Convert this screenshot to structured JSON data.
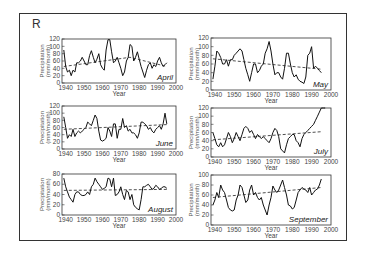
{
  "figure": {
    "panel_letter": "R"
  },
  "chart_data": [
    {
      "type": "line",
      "title": "April",
      "xlabel": "Year",
      "ylabel": "Precipitation (mm/month)",
      "xticks": [
        1940,
        1950,
        1960,
        1970,
        1980,
        1990,
        2000
      ],
      "yticks": [
        0,
        20,
        40,
        60,
        80,
        100,
        120
      ],
      "xlim": [
        1938,
        2000
      ],
      "ylim": [
        0,
        120
      ],
      "x": [
        1939,
        1940,
        1941,
        1942,
        1943,
        1944,
        1945,
        1946,
        1947,
        1948,
        1949,
        1950,
        1951,
        1952,
        1953,
        1954,
        1955,
        1956,
        1957,
        1958,
        1959,
        1960,
        1961,
        1962,
        1963,
        1964,
        1965,
        1966,
        1967,
        1968,
        1969,
        1970,
        1971,
        1972,
        1973,
        1974,
        1975,
        1976,
        1977,
        1978,
        1979,
        1980,
        1981,
        1982,
        1983,
        1984,
        1985,
        1986,
        1987,
        1988,
        1989,
        1990,
        1991,
        1992,
        1993,
        1994,
        1995
      ],
      "series": [
        {
          "name": "Observed",
          "values": [
            90,
            45,
            30,
            35,
            20,
            35,
            30,
            55,
            55,
            60,
            70,
            60,
            50,
            50,
            75,
            88,
            70,
            55,
            65,
            80,
            50,
            40,
            35,
            90,
            118,
            118,
            85,
            55,
            60,
            70,
            55,
            40,
            20,
            30,
            60,
            70,
            105,
            100,
            60,
            70,
            85,
            65,
            45,
            30,
            15,
            35,
            50,
            55,
            40,
            50,
            45,
            60,
            70,
            55,
            45,
            50,
            55
          ]
        },
        {
          "name": "Trend",
          "style": "dashed",
          "values_endpoints": {
            "1939": 45,
            "1975": 70,
            "1995": 45
          }
        }
      ]
    },
    {
      "type": "line",
      "title": "May",
      "xlabel": "Year",
      "ylabel": "Precipitation (mm/month)",
      "xticks": [
        1940,
        1950,
        1960,
        1970,
        1980,
        1990,
        2000
      ],
      "yticks": [
        0,
        20,
        40,
        60,
        80,
        100,
        120
      ],
      "xlim": [
        1938,
        2000
      ],
      "ylim": [
        0,
        120
      ],
      "x": [
        1939,
        1940,
        1941,
        1942,
        1943,
        1944,
        1945,
        1946,
        1947,
        1948,
        1949,
        1950,
        1951,
        1952,
        1953,
        1954,
        1955,
        1956,
        1957,
        1958,
        1959,
        1960,
        1961,
        1962,
        1963,
        1964,
        1965,
        1966,
        1967,
        1968,
        1969,
        1970,
        1971,
        1972,
        1973,
        1974,
        1975,
        1976,
        1977,
        1978,
        1979,
        1980,
        1981,
        1982,
        1983,
        1984,
        1985,
        1986,
        1987,
        1988,
        1989,
        1990,
        1991,
        1992,
        1993,
        1994,
        1995
      ],
      "series": [
        {
          "name": "Observed",
          "values": [
            25,
            55,
            90,
            85,
            75,
            60,
            60,
            70,
            55,
            70,
            70,
            80,
            85,
            90,
            95,
            90,
            70,
            50,
            35,
            20,
            40,
            60,
            60,
            40,
            45,
            55,
            60,
            85,
            95,
            112,
            90,
            60,
            35,
            40,
            40,
            30,
            25,
            50,
            85,
            85,
            60,
            40,
            30,
            35,
            25,
            20,
            18,
            15,
            30,
            80,
            85,
            100,
            50,
            55,
            50,
            45,
            40
          ]
        },
        {
          "name": "Trend",
          "style": "dashed",
          "values_endpoints": {
            "1939": 72,
            "1995": 48
          }
        }
      ]
    },
    {
      "type": "line",
      "title": "June",
      "xlabel": "Year",
      "ylabel": "Precipitation (mm/month)",
      "xticks": [
        1940,
        1950,
        1960,
        1970,
        1980,
        1990,
        2000
      ],
      "yticks": [
        0,
        20,
        40,
        60,
        80,
        100,
        120
      ],
      "xlim": [
        1938,
        2000
      ],
      "ylim": [
        0,
        120
      ],
      "x": [
        1939,
        1940,
        1941,
        1942,
        1943,
        1944,
        1945,
        1946,
        1947,
        1948,
        1949,
        1950,
        1951,
        1952,
        1953,
        1954,
        1955,
        1956,
        1957,
        1958,
        1959,
        1960,
        1961,
        1962,
        1963,
        1964,
        1965,
        1966,
        1967,
        1968,
        1969,
        1970,
        1971,
        1972,
        1973,
        1974,
        1975,
        1976,
        1977,
        1978,
        1979,
        1980,
        1981,
        1982,
        1983,
        1984,
        1985,
        1986,
        1987,
        1988,
        1989,
        1990,
        1991,
        1992,
        1993,
        1994,
        1995
      ],
      "series": [
        {
          "name": "Observed",
          "values": [
            90,
            60,
            30,
            40,
            35,
            55,
            35,
            45,
            50,
            45,
            50,
            55,
            60,
            75,
            70,
            65,
            80,
            95,
            85,
            50,
            25,
            22,
            25,
            30,
            60,
            50,
            35,
            70,
            70,
            30,
            55,
            55,
            85,
            60,
            65,
            50,
            55,
            45,
            45,
            40,
            30,
            45,
            75,
            75,
            70,
            65,
            55,
            60,
            50,
            45,
            55,
            60,
            65,
            55,
            70,
            100,
            70
          ]
        },
        {
          "name": "Trend",
          "style": "dashed",
          "values_endpoints": {
            "1939": 55,
            "1995": 68
          }
        }
      ]
    },
    {
      "type": "line",
      "title": "July",
      "xlabel": "Year",
      "ylabel": "Precipitation (mm/month)",
      "xticks": [
        1940,
        1950,
        1960,
        1970,
        1980,
        1990,
        2000
      ],
      "yticks": [
        0,
        20,
        40,
        60,
        80,
        100,
        120
      ],
      "xlim": [
        1938,
        2000
      ],
      "ylim": [
        0,
        120
      ],
      "x": [
        1939,
        1940,
        1941,
        1942,
        1943,
        1944,
        1945,
        1946,
        1947,
        1948,
        1949,
        1950,
        1951,
        1952,
        1953,
        1954,
        1955,
        1956,
        1957,
        1958,
        1959,
        1960,
        1961,
        1962,
        1963,
        1964,
        1965,
        1966,
        1967,
        1968,
        1969,
        1970,
        1971,
        1972,
        1973,
        1974,
        1975,
        1976,
        1977,
        1978,
        1979,
        1980,
        1981,
        1982,
        1983,
        1984,
        1985,
        1986,
        1987,
        1988,
        1989,
        1990,
        1991,
        1992,
        1993,
        1994,
        1995,
        1996,
        1997
      ],
      "series": [
        {
          "name": "Observed",
          "values": [
            60,
            45,
            30,
            25,
            35,
            25,
            30,
            45,
            60,
            50,
            35,
            45,
            60,
            50,
            40,
            55,
            70,
            75,
            70,
            60,
            65,
            55,
            45,
            55,
            50,
            45,
            50,
            45,
            40,
            35,
            45,
            60,
            70,
            65,
            50,
            20,
            15,
            10,
            30,
            45,
            50,
            55,
            55,
            40,
            35,
            25,
            45,
            55,
            60,
            65,
            70,
            75,
            80,
            90,
            100,
            110,
            120,
            120,
            120
          ]
        },
        {
          "name": "Trend",
          "style": "dashed",
          "values_endpoints": {
            "1939": 42,
            "1995": 62
          }
        }
      ]
    },
    {
      "type": "line",
      "title": "August",
      "xlabel": "Year",
      "ylabel": "Precipitation (mm/month)",
      "xticks": [
        1940,
        1950,
        1960,
        1970,
        1980,
        1990,
        2000
      ],
      "yticks": [
        0,
        20,
        40,
        60,
        80
      ],
      "xlim": [
        1938,
        2000
      ],
      "ylim": [
        0,
        80
      ],
      "x": [
        1939,
        1940,
        1941,
        1942,
        1943,
        1944,
        1945,
        1946,
        1947,
        1948,
        1949,
        1950,
        1951,
        1952,
        1953,
        1954,
        1955,
        1956,
        1957,
        1958,
        1959,
        1960,
        1961,
        1962,
        1963,
        1964,
        1965,
        1966,
        1967,
        1968,
        1969,
        1970,
        1971,
        1972,
        1973,
        1974,
        1975,
        1976,
        1977,
        1978,
        1979,
        1980,
        1981,
        1982,
        1983,
        1984,
        1985,
        1986,
        1987,
        1988,
        1989,
        1990,
        1991,
        1992,
        1993,
        1994,
        1995
      ],
      "series": [
        {
          "name": "Observed",
          "values": [
            72,
            55,
            45,
            35,
            30,
            25,
            40,
            45,
            45,
            40,
            38,
            38,
            40,
            45,
            40,
            55,
            60,
            72,
            65,
            60,
            55,
            50,
            52,
            55,
            72,
            70,
            55,
            72,
            38,
            40,
            45,
            55,
            40,
            30,
            48,
            45,
            30,
            40,
            20,
            15,
            12,
            10,
            30,
            55,
            55,
            58,
            60,
            55,
            50,
            52,
            58,
            55,
            50,
            52,
            55,
            55,
            52
          ]
        },
        {
          "name": "Trend",
          "style": "dashed",
          "values_endpoints": {
            "1939": 48,
            "1995": 50
          }
        }
      ]
    },
    {
      "type": "line",
      "title": "September",
      "xlabel": "Year",
      "ylabel": "Precipitation (mm/month)",
      "xticks": [
        1940,
        1950,
        1960,
        1970,
        1980,
        1990,
        2000
      ],
      "yticks": [
        0,
        20,
        40,
        60,
        80,
        100
      ],
      "xlim": [
        1938,
        2000
      ],
      "ylim": [
        0,
        100
      ],
      "x": [
        1939,
        1940,
        1941,
        1942,
        1943,
        1944,
        1945,
        1946,
        1947,
        1948,
        1949,
        1950,
        1951,
        1952,
        1953,
        1954,
        1955,
        1956,
        1957,
        1958,
        1959,
        1960,
        1961,
        1962,
        1963,
        1964,
        1965,
        1966,
        1967,
        1968,
        1969,
        1970,
        1971,
        1972,
        1973,
        1974,
        1975,
        1976,
        1977,
        1978,
        1979,
        1980,
        1981,
        1982,
        1983,
        1984,
        1985,
        1986,
        1987,
        1988,
        1989,
        1990,
        1991,
        1992,
        1993,
        1994,
        1995
      ],
      "series": [
        {
          "name": "Observed",
          "values": [
            40,
            50,
            65,
            55,
            80,
            70,
            65,
            50,
            35,
            30,
            28,
            30,
            50,
            60,
            80,
            75,
            60,
            45,
            50,
            70,
            80,
            60,
            65,
            55,
            50,
            55,
            40,
            30,
            20,
            40,
            55,
            78,
            70,
            65,
            70,
            80,
            90,
            75,
            60,
            40,
            38,
            32,
            35,
            50,
            65,
            70,
            75,
            72,
            70,
            65,
            75,
            60,
            65,
            70,
            72,
            80,
            92
          ]
        },
        {
          "name": "Trend",
          "style": "dashed",
          "values_endpoints": {
            "1939": 55,
            "1995": 75
          }
        }
      ]
    }
  ]
}
